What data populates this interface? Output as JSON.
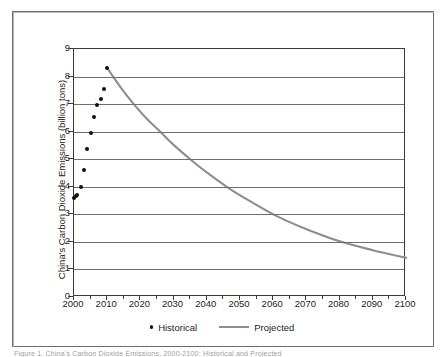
{
  "figure": {
    "caption_sliver": "Figure 1.  China's Carbon Dioxide Emissions, 2000-2100: Historical and Projected"
  },
  "legend": {
    "position": "bottom-center",
    "entries": [
      {
        "label": "Historical",
        "marker": "dot",
        "color": "#101010"
      },
      {
        "label": "Projected",
        "marker": "line",
        "color": "#8e8e8e"
      }
    ]
  },
  "chart_data": {
    "type": "scatter",
    "title": "",
    "subtitle": "",
    "xlabel": "",
    "ylabel": "China's Carbon Dioxide Emissions (billion tons)",
    "xlim": [
      2000,
      2100
    ],
    "ylim": [
      0,
      9
    ],
    "grid": "horizontal",
    "x_ticks": [
      2000,
      2010,
      2020,
      2030,
      2040,
      2050,
      2060,
      2070,
      2080,
      2090,
      2100
    ],
    "x_tick_labels": [
      "2000",
      "2010",
      "2020",
      "2030",
      "2040",
      "2050",
      "2060",
      "2070",
      "2080",
      "2090",
      "2100"
    ],
    "x_minor_tick_interval": 5,
    "y_ticks": [
      0,
      1,
      2,
      3,
      4,
      5,
      6,
      7,
      8,
      9
    ],
    "y_tick_labels": [
      "0",
      "1",
      "2",
      "3",
      "4",
      "5",
      "6",
      "7",
      "8",
      "9"
    ],
    "series": [
      {
        "name": "Historical",
        "type": "scatter",
        "color": "#101010",
        "points": [
          {
            "x": 2000,
            "y": 3.6
          },
          {
            "x": 2000.6,
            "y": 3.65
          },
          {
            "x": 2001,
            "y": 3.7
          },
          {
            "x": 2002,
            "y": 3.98
          },
          {
            "x": 2003,
            "y": 4.62
          },
          {
            "x": 2004,
            "y": 5.37
          },
          {
            "x": 2005,
            "y": 5.95
          },
          {
            "x": 2006,
            "y": 6.52
          },
          {
            "x": 2007,
            "y": 6.96
          },
          {
            "x": 2008,
            "y": 7.18
          },
          {
            "x": 2009,
            "y": 7.55
          },
          {
            "x": 2010,
            "y": 8.31
          }
        ]
      },
      {
        "name": "Projected",
        "type": "line",
        "color": "#8e8e8e",
        "points": [
          {
            "x": 2010,
            "y": 8.31
          },
          {
            "x": 2014,
            "y": 7.62
          },
          {
            "x": 2018,
            "y": 7.0
          },
          {
            "x": 2022,
            "y": 6.46
          },
          {
            "x": 2026,
            "y": 6.0
          },
          {
            "x": 2030,
            "y": 5.52
          },
          {
            "x": 2035,
            "y": 5.0
          },
          {
            "x": 2040,
            "y": 4.52
          },
          {
            "x": 2046,
            "y": 4.0
          },
          {
            "x": 2052,
            "y": 3.55
          },
          {
            "x": 2060,
            "y": 3.0
          },
          {
            "x": 2068,
            "y": 2.56
          },
          {
            "x": 2080,
            "y": 2.02
          },
          {
            "x": 2090,
            "y": 1.7
          },
          {
            "x": 2100,
            "y": 1.42
          }
        ]
      }
    ]
  }
}
